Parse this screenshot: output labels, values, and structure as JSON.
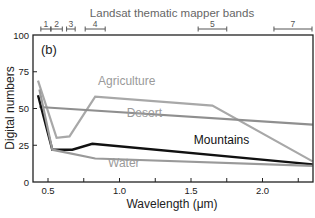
{
  "chart_data": {
    "type": "line",
    "panel_label": "(b)",
    "title": "Landsat thematic mapper bands",
    "xlabel": "Wavelength (μm)",
    "ylabel": "Digital numbers",
    "xlim": [
      0.4,
      2.35
    ],
    "ylim": [
      0,
      100
    ],
    "xticks": [
      0.5,
      0.75,
      1.0,
      1.25,
      1.5,
      1.75,
      2.0,
      2.25
    ],
    "xtick_labels": [
      "0.5",
      "",
      "1.0",
      "",
      "1.5",
      "",
      "2.0",
      ""
    ],
    "yticks": [
      0,
      25,
      50,
      75,
      100
    ],
    "ytick_labels": [
      "0",
      "25",
      "50",
      "75",
      "100"
    ],
    "grid": false,
    "bands": [
      {
        "label": "1",
        "range": [
          0.45,
          0.52
        ]
      },
      {
        "label": "2",
        "range": [
          0.52,
          0.6
        ]
      },
      {
        "label": "3",
        "range": [
          0.63,
          0.69
        ]
      },
      {
        "label": "4",
        "range": [
          0.76,
          0.9
        ]
      },
      {
        "label": "5",
        "range": [
          1.55,
          1.75
        ]
      },
      {
        "label": "7",
        "range": [
          2.08,
          2.35
        ]
      }
    ],
    "series": [
      {
        "name": "Agriculture",
        "color": "#a8a8a8",
        "width": 2.2,
        "x": [
          0.43,
          0.56,
          0.65,
          0.83,
          1.65,
          2.35
        ],
        "y": [
          69,
          30,
          31,
          58,
          52,
          14
        ],
        "label_pos": [
          0.85,
          66
        ]
      },
      {
        "name": "Desert",
        "color": "#8f8f8f",
        "width": 2.2,
        "x": [
          0.44,
          2.35
        ],
        "y": [
          51,
          39
        ],
        "label_pos": [
          1.05,
          44
        ]
      },
      {
        "name": "Mountains",
        "color": "#111111",
        "width": 2.4,
        "x": [
          0.43,
          0.53,
          0.67,
          0.81,
          2.35
        ],
        "y": [
          59,
          22,
          22,
          26,
          12
        ],
        "label_pos": [
          1.52,
          26
        ]
      },
      {
        "name": "Water",
        "color": "#9a9a9a",
        "width": 2.2,
        "x": [
          0.44,
          0.53,
          0.83,
          2.35
        ],
        "y": [
          63,
          22,
          16,
          11
        ],
        "label_pos": [
          0.92,
          10
        ]
      }
    ]
  }
}
